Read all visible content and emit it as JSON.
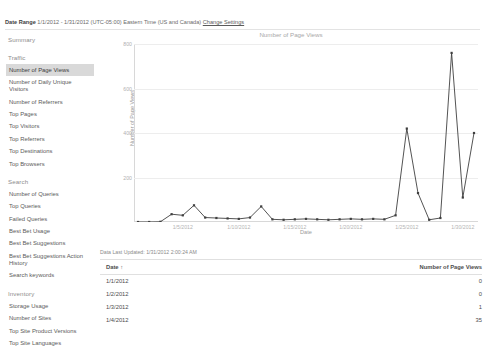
{
  "header": {
    "date_range_label": "Date Range",
    "date_range_value": "1/1/2012 - 1/31/2012 (UTC-05:00) Eastern Time (US and Canada)",
    "change_settings_link": "Change Settings"
  },
  "sidebar": {
    "groups": [
      {
        "heading": "Summary",
        "items": []
      },
      {
        "heading": "Traffic",
        "items": [
          {
            "label": "Number of Page Views",
            "selected": true
          },
          {
            "label": "Number of Daily Unique Visitors",
            "selected": false
          },
          {
            "label": "Number of Referrers",
            "selected": false
          },
          {
            "label": "Top Pages",
            "selected": false
          },
          {
            "label": "Top Visitors",
            "selected": false
          },
          {
            "label": "Top Referrers",
            "selected": false
          },
          {
            "label": "Top Destinations",
            "selected": false
          },
          {
            "label": "Top Browsers",
            "selected": false
          }
        ]
      },
      {
        "heading": "Search",
        "items": [
          {
            "label": "Number of Queries",
            "selected": false
          },
          {
            "label": "Top Queries",
            "selected": false
          },
          {
            "label": "Failed Queries",
            "selected": false
          },
          {
            "label": "Best Bet Usage",
            "selected": false
          },
          {
            "label": "Best Bet Suggestions",
            "selected": false
          },
          {
            "label": "Best Bet Suggestions Action History",
            "selected": false
          },
          {
            "label": "Search keywords",
            "selected": false
          }
        ]
      },
      {
        "heading": "Inventory",
        "items": [
          {
            "label": "Storage Usage",
            "selected": false
          },
          {
            "label": "Number of Sites",
            "selected": false
          },
          {
            "label": "Top Site Product Versions",
            "selected": false
          },
          {
            "label": "Top Site Languages",
            "selected": false
          }
        ]
      }
    ]
  },
  "chart_data": {
    "type": "line",
    "title": "Number of Page Views",
    "xlabel": "Date",
    "ylabel": "Number of Page Views",
    "ylim": [
      0,
      800
    ],
    "yticks": [
      200,
      400,
      600,
      800
    ],
    "grid": true,
    "legend": "none",
    "series_color": "#3f3f3f",
    "x": [
      "1/1/2012",
      "1/2/2012",
      "1/3/2012",
      "1/4/2012",
      "1/5/2012",
      "1/6/2012",
      "1/7/2012",
      "1/8/2012",
      "1/9/2012",
      "1/10/2012",
      "1/11/2012",
      "1/12/2012",
      "1/13/2012",
      "1/14/2012",
      "1/15/2012",
      "1/16/2012",
      "1/17/2012",
      "1/18/2012",
      "1/19/2012",
      "1/20/2012",
      "1/21/2012",
      "1/22/2012",
      "1/23/2012",
      "1/24/2012",
      "1/25/2012",
      "1/26/2012",
      "1/27/2012",
      "1/28/2012",
      "1/29/2012",
      "1/30/2012",
      "1/31/2012"
    ],
    "xticks": [
      "1/5/2012",
      "1/10/2012",
      "1/15/2012",
      "1/20/2012",
      "1/25/2012",
      "1/30/2012"
    ],
    "xtick_indices": [
      4,
      9,
      14,
      19,
      24,
      29
    ],
    "values": [
      0,
      0,
      1,
      35,
      30,
      75,
      20,
      18,
      16,
      14,
      20,
      70,
      12,
      10,
      12,
      14,
      12,
      10,
      12,
      14,
      12,
      14,
      12,
      30,
      420,
      130,
      10,
      18,
      760,
      110,
      400
    ]
  },
  "data_table": {
    "updated_text": "Data Last Updated: 1/31/2012 2:00:24 AM",
    "columns": [
      "Date ↑",
      "Number of Page Views"
    ],
    "rows": [
      {
        "date": "1/1/2012",
        "views": "0"
      },
      {
        "date": "1/2/2012",
        "views": "0"
      },
      {
        "date": "1/3/2012",
        "views": "1"
      },
      {
        "date": "1/4/2012",
        "views": "35"
      }
    ]
  }
}
